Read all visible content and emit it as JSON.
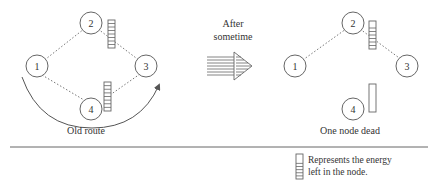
{
  "transition": {
    "label_lines": [
      "After",
      "sometime"
    ]
  },
  "panels": {
    "before": {
      "caption": "Old route",
      "nodes": [
        {
          "id": "1",
          "energy_fraction": null
        },
        {
          "id": "2",
          "energy_fraction": 1.0
        },
        {
          "id": "3",
          "energy_fraction": null
        },
        {
          "id": "4",
          "energy_fraction": 1.0
        }
      ],
      "links": [
        [
          "1",
          "2"
        ],
        [
          "2",
          "3"
        ],
        [
          "1",
          "4"
        ],
        [
          "4",
          "3"
        ]
      ],
      "route_arrow": {
        "from": "1",
        "to": "3",
        "via": "4"
      }
    },
    "after": {
      "caption": "One node dead",
      "nodes": [
        {
          "id": "1",
          "energy_fraction": null
        },
        {
          "id": "2",
          "energy_fraction": 0.75
        },
        {
          "id": "3",
          "energy_fraction": null
        },
        {
          "id": "4",
          "energy_fraction": 0.0
        }
      ],
      "links": [
        [
          "1",
          "2"
        ],
        [
          "2",
          "3"
        ]
      ]
    }
  },
  "legend": {
    "lines": [
      "Represents the energy",
      "left in the node."
    ]
  }
}
